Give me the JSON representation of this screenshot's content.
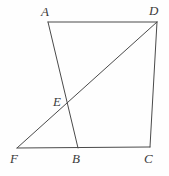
{
  "figure": {
    "type": "geometry-diagram",
    "background_color": "#fefefe",
    "stroke_color": "#4a4a4a",
    "stroke_width": 1,
    "label_color": "#3b3b3b",
    "points": {
      "A": {
        "label": "A",
        "x": 48,
        "y": 22,
        "label_x": 41,
        "label_y": 5
      },
      "D": {
        "label": "D",
        "x": 157,
        "y": 22,
        "label_x": 149,
        "label_y": 4
      },
      "E": {
        "label": "E",
        "x": 68,
        "y": 104,
        "label_x": 53,
        "label_y": 95
      },
      "F": {
        "label": "F",
        "x": 17,
        "y": 148,
        "label_x": 10,
        "label_y": 152
      },
      "B": {
        "label": "B",
        "x": 78,
        "y": 148,
        "label_x": 72,
        "label_y": 152
      },
      "C": {
        "label": "C",
        "x": 150,
        "y": 147,
        "label_x": 144,
        "label_y": 152
      }
    },
    "segments": [
      {
        "name": "segment-AD",
        "from": "A",
        "to": "D"
      },
      {
        "name": "segment-AB",
        "from": "A",
        "to": "B"
      },
      {
        "name": "segment-FD",
        "from": "F",
        "to": "D"
      },
      {
        "name": "segment-DC",
        "from": "D",
        "to": "C"
      },
      {
        "name": "segment-FC",
        "from": "F",
        "to": "C"
      }
    ]
  }
}
